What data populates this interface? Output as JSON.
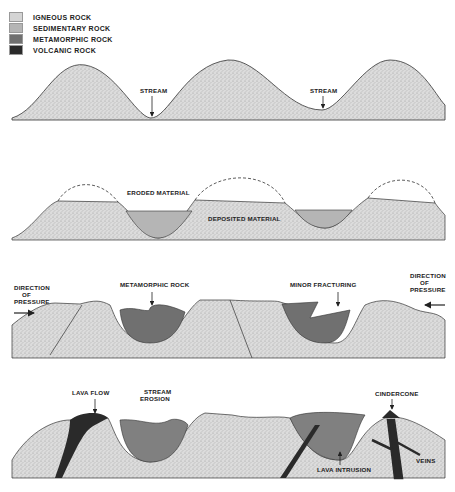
{
  "legend": {
    "items": [
      {
        "label": "IGNEOUS ROCK",
        "pattern": "stippled",
        "color": "#d4d4d4"
      },
      {
        "label": "SEDIMENTARY ROCK",
        "pattern": "solid",
        "color": "#b5b5b5"
      },
      {
        "label": "METAMORPHIC ROCK",
        "pattern": "solid",
        "color": "#707070"
      },
      {
        "label": "VOLCANIC ROCK",
        "pattern": "solid",
        "color": "#2a2a2a"
      }
    ]
  },
  "panels": [
    {
      "id": "panel-1",
      "labels": {
        "stream_left": "STREAM",
        "stream_right": "STREAM"
      }
    },
    {
      "id": "panel-2",
      "labels": {
        "eroded": "ERODED MATERIAL",
        "deposited": "DEPOSITED MATERIAL"
      }
    },
    {
      "id": "panel-3",
      "labels": {
        "direction_left": [
          "DIRECTION",
          "OF",
          "PRESSURE"
        ],
        "metamorphic": "METAMORPHIC ROCK",
        "minor_fracturing": "MINOR FRACTURING",
        "direction_right": [
          "DIRECTION",
          "OF",
          "PRESSURE"
        ],
        "fault_left": "FAULT",
        "fault_right": "FAULT"
      }
    },
    {
      "id": "panel-4",
      "labels": {
        "lava_flow": "LAVA FLOW",
        "stream_erosion": [
          "STREAM",
          "EROSION"
        ],
        "cindercone": "CINDERCONE",
        "lava_intrusion": "LAVA INTRUSION",
        "veins": "VEINS"
      }
    }
  ]
}
